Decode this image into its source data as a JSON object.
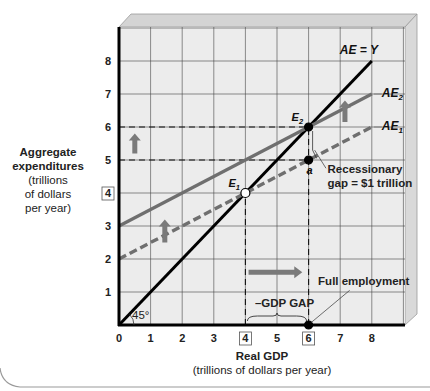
{
  "chart_data": {
    "type": "line",
    "title": "",
    "xlabel": "Real GDP",
    "xlabel_sub": "(trillions of dollars per year)",
    "ylabel": "Aggregate expenditures",
    "ylabel_sub": [
      "(trillions",
      "of dollars",
      "per year)"
    ],
    "xlim": [
      0,
      8.5
    ],
    "ylim": [
      0,
      8.5
    ],
    "x_ticks": [
      "0",
      "1",
      "2",
      "3",
      "4",
      "5",
      "6",
      "7",
      "8"
    ],
    "y_ticks": [
      "1",
      "2",
      "3",
      "4",
      "5",
      "6",
      "7",
      "8"
    ],
    "boxed_x_ticks": [
      "4",
      "6"
    ],
    "boxed_y_ticks": [
      "4"
    ],
    "grid": true,
    "series": [
      {
        "name": "AE = Y",
        "style": "solid-black",
        "points": [
          [
            0,
            0
          ],
          [
            8,
            8
          ]
        ]
      },
      {
        "name": "AE2",
        "style": "solid-gray",
        "points": [
          [
            0,
            3
          ],
          [
            8,
            7
          ]
        ]
      },
      {
        "name": "AE1",
        "style": "dashed-gray",
        "points": [
          [
            0,
            2
          ],
          [
            8,
            6
          ]
        ]
      }
    ],
    "points": [
      {
        "label": "E1",
        "x": 4,
        "y": 4,
        "marker": "open"
      },
      {
        "label": "E2",
        "x": 6,
        "y": 6,
        "marker": "filled"
      },
      {
        "label": "a",
        "x": 6,
        "y": 5,
        "marker": "filled"
      },
      {
        "label": "",
        "x": 6,
        "y": 0,
        "marker": "filled"
      }
    ],
    "reference_lines": [
      {
        "orientation": "horizontal",
        "y": 6,
        "from_x": 0,
        "to_x": 6,
        "style": "dashed"
      },
      {
        "orientation": "horizontal",
        "y": 5,
        "from_x": 0,
        "to_x": 6,
        "style": "dashed"
      },
      {
        "orientation": "vertical",
        "x": 4,
        "from_y": 0,
        "to_y": 4,
        "style": "dashed"
      },
      {
        "orientation": "vertical",
        "x": 6,
        "from_y": 0,
        "to_y": 6,
        "style": "dashed"
      }
    ],
    "arrows": [
      {
        "direction": "up",
        "x": 0.5,
        "y_from": 5.2,
        "y_to": 5.8
      },
      {
        "direction": "up",
        "x": 1.45,
        "y_from": 2.5,
        "y_to": 3.2
      },
      {
        "direction": "up",
        "x": 7.15,
        "y_from": 6.15,
        "y_to": 6.8
      },
      {
        "direction": "right",
        "y": 1.6,
        "x_from": 4.1,
        "x_to": 5.8
      }
    ],
    "annotations": [
      {
        "text": "Recessionary",
        "line2": "gap = $1 trillion",
        "x": 6.6,
        "y": 4.6
      },
      {
        "text": "Full employment",
        "x": 6.3,
        "y": 1.2
      },
      {
        "text": "–GDP GAP",
        "x": 4.3,
        "y": 0.55
      },
      {
        "text": "45°",
        "x": 0.35,
        "y": 0.25
      }
    ],
    "legend": "none"
  }
}
